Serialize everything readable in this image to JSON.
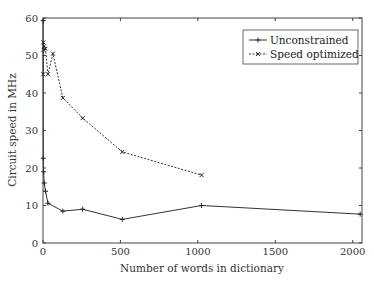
{
  "chart_data": {
    "type": "line",
    "title": "",
    "xlabel": "Number of words in dictionary",
    "ylabel": "Circuit speed in MHz",
    "xlim": [
      0,
      2060
    ],
    "ylim": [
      0,
      60
    ],
    "xticks": [
      0,
      500,
      1000,
      1500,
      2000
    ],
    "yticks": [
      0,
      10,
      20,
      30,
      40,
      50,
      60
    ],
    "grid": false,
    "legend_position": "top-right",
    "series": [
      {
        "name": "Unconstrained",
        "style": "solid",
        "marker": "+",
        "x": [
          1,
          2,
          4,
          8,
          16,
          32,
          128,
          256,
          512,
          1024,
          2048
        ],
        "y": [
          59.3,
          22.6,
          19.0,
          16.0,
          13.8,
          10.6,
          8.5,
          9.0,
          6.3,
          10.0,
          7.7
        ]
      },
      {
        "name": "Speed optimized",
        "style": "dashed",
        "marker": "x",
        "x": [
          1,
          2,
          4,
          8,
          16,
          32,
          64,
          128,
          256,
          512,
          1024
        ],
        "y": [
          45.0,
          53.5,
          51.5,
          52.5,
          51.8,
          45.0,
          50.5,
          38.7,
          33.3,
          24.3,
          18.1
        ]
      }
    ]
  }
}
